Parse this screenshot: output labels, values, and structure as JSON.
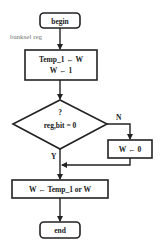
{
  "diagram": {
    "type": "flowchart",
    "nodes": {
      "begin": {
        "label": "begin",
        "shape": "terminator"
      },
      "assign1": {
        "line1": "Temp_1 ← W",
        "line2": "W ← 1",
        "shape": "process"
      },
      "decision": {
        "line1": "?",
        "line2": "reg,bit = 0",
        "shape": "decision"
      },
      "assign_zero": {
        "label": "W ← 0",
        "shape": "process"
      },
      "assign_or": {
        "label": "W ← Temp_1 or W",
        "shape": "process"
      },
      "end": {
        "label": "end",
        "shape": "terminator"
      }
    },
    "edge_labels": {
      "banksel": "banksel reg",
      "no": "N",
      "yes": "Y"
    },
    "edges": [
      {
        "from": "begin",
        "to": "assign1",
        "label": "banksel reg"
      },
      {
        "from": "assign1",
        "to": "decision"
      },
      {
        "from": "decision",
        "to": "assign_zero",
        "label": "N"
      },
      {
        "from": "decision",
        "to": "assign_or",
        "label": "Y"
      },
      {
        "from": "assign_zero",
        "to": "assign_or"
      },
      {
        "from": "assign_or",
        "to": "end"
      }
    ],
    "colors": {
      "stroke": "#222222",
      "text": "#222222",
      "label": "#777777",
      "background": "#ffffff"
    }
  }
}
